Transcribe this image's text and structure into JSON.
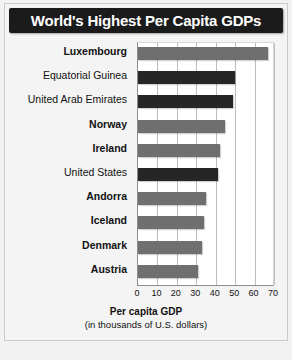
{
  "chart_data": {
    "type": "bar",
    "orientation": "horizontal",
    "title": "World's Highest Per Capita GDPs",
    "xlabel": "Per capita GDP",
    "xlabel_sub": "(in thousands of U.S. dollars)",
    "ylabel": "",
    "xlim": [
      0,
      70
    ],
    "xticks": [
      0,
      10,
      20,
      30,
      40,
      50,
      60,
      70
    ],
    "grid": true,
    "legend_position": "inside-right",
    "categories": [
      "Luxembourg",
      "Equatorial Guinea",
      "United Arab Emirates",
      "Norway",
      "Ireland",
      "United States",
      "Andorra",
      "Iceland",
      "Denmark",
      "Austria"
    ],
    "values": [
      67,
      50,
      49,
      45,
      42,
      41,
      35,
      34,
      33,
      31
    ],
    "groups": [
      "European Countries",
      "Other Countries",
      "Other Countries",
      "European Countries",
      "European Countries",
      "Other Countries",
      "European Countries",
      "European Countries",
      "European Countries",
      "European Countries"
    ],
    "legend": [
      {
        "label_line1": "European",
        "label_line2": "Countries",
        "color": "#6f6f6f",
        "key": "euro"
      },
      {
        "label_line1": "Other",
        "label_line2": "Countries",
        "color": "#262626",
        "key": "other"
      }
    ],
    "colors": {
      "european": "#6f6f6f",
      "other": "#262626",
      "title_bar": "#1b1b1b",
      "title_text": "#ffffff",
      "background": "#f4f4f4",
      "plot_background": "#ffffff",
      "gridline": "#bdbdbd"
    }
  }
}
